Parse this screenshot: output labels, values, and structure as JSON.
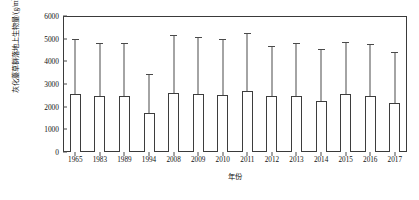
{
  "chart_data": {
    "type": "bar",
    "title": "",
    "xlabel": "年份",
    "ylabel": "灰化薹草群落地上生物量/(g/m²)",
    "ylabel_main": "灰化薹草群落地上生物量/(g/m",
    "ylabel_sup": "2",
    "ylabel_tail": ")",
    "categories": [
      "1965",
      "1983",
      "1989",
      "1994",
      "2008",
      "2009",
      "2010",
      "2011",
      "2012",
      "2013",
      "2014",
      "2015",
      "2016",
      "2017"
    ],
    "values": [
      2550,
      2450,
      2450,
      1700,
      2620,
      2570,
      2530,
      2700,
      2450,
      2470,
      2250,
      2550,
      2450,
      2150
    ],
    "error_upper": [
      5000,
      4800,
      4830,
      3430,
      5180,
      5080,
      5000,
      5250,
      4680,
      4800,
      4550,
      4850,
      4750,
      4400
    ],
    "ylim": [
      0,
      6000
    ],
    "yticks": [
      0,
      1000,
      2000,
      3000,
      4000,
      5000,
      6000
    ],
    "ytick_labels": [
      "0",
      "1000",
      "2000",
      "3000",
      "4000",
      "5000",
      "6000"
    ],
    "grid": false,
    "legend": "none",
    "bar_fill": "#ffffff",
    "bar_border": "#3d3d3d",
    "error_color": "#4a4a4a",
    "axis_color": "#3a3a3a",
    "error_style": "upper-only"
  }
}
